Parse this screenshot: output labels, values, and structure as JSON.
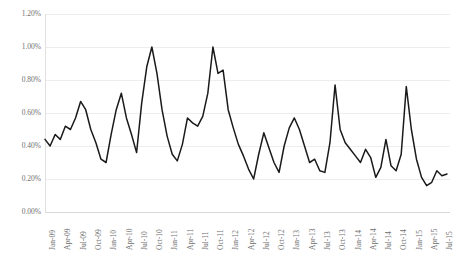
{
  "chart_data": {
    "type": "line",
    "title": "",
    "subtitle": "",
    "xlabel": "",
    "ylabel": "",
    "grid": true,
    "grid_orientation": "horizontal",
    "legend": "none",
    "line_color": "#1a1a1a",
    "axis_color": "#d9d9d9",
    "grid_color": "#e8e8e8",
    "tick_label_color": "#6f6f6f",
    "ylim": [
      0.0,
      1.2
    ],
    "ytick_values": [
      0.0,
      0.2,
      0.4,
      0.6,
      0.8,
      1.0,
      1.2
    ],
    "ytick_labels": [
      "0.00%",
      "0.20%",
      "0.40%",
      "0.60%",
      "0.80%",
      "1.00%",
      "1.20%"
    ],
    "xtick_labels": [
      "Jan-09",
      "Apr-09",
      "Jul-09",
      "Oct-09",
      "Jan-10",
      "Apr-10",
      "Jul-10",
      "Oct-10",
      "Jan-11",
      "Apr-11",
      "Jul-11",
      "Oct-11",
      "Jan-12",
      "Apr-12",
      "Jul-12",
      "Oct-12",
      "Jan-13",
      "Apr-13",
      "Jul-13",
      "Oct-13",
      "Jan-14",
      "Apr-14",
      "Jul-14",
      "Oct-14",
      "Jan-15",
      "Apr-15",
      "Jul-15"
    ],
    "xtick_interval_months": 3,
    "x_start": "Jan-09",
    "x_end": "Jul-15",
    "x_frequency": "monthly",
    "series": [
      {
        "name": "Rate",
        "values": [
          0.44,
          0.4,
          0.47,
          0.44,
          0.52,
          0.5,
          0.57,
          0.67,
          0.62,
          0.5,
          0.42,
          0.32,
          0.3,
          0.47,
          0.62,
          0.72,
          0.57,
          0.47,
          0.36,
          0.66,
          0.88,
          1.0,
          0.84,
          0.62,
          0.46,
          0.35,
          0.31,
          0.41,
          0.57,
          0.54,
          0.52,
          0.58,
          0.72,
          1.0,
          0.84,
          0.86,
          0.62,
          0.51,
          0.41,
          0.34,
          0.26,
          0.2,
          0.35,
          0.48,
          0.39,
          0.3,
          0.24,
          0.4,
          0.51,
          0.57,
          0.5,
          0.4,
          0.3,
          0.32,
          0.25,
          0.24,
          0.42,
          0.77,
          0.5,
          0.42,
          0.38,
          0.34,
          0.3,
          0.38,
          0.33,
          0.21,
          0.27,
          0.44,
          0.28,
          0.25,
          0.35,
          0.76,
          0.5,
          0.32,
          0.21,
          0.16,
          0.18,
          0.25,
          0.22,
          0.23
        ]
      }
    ]
  }
}
